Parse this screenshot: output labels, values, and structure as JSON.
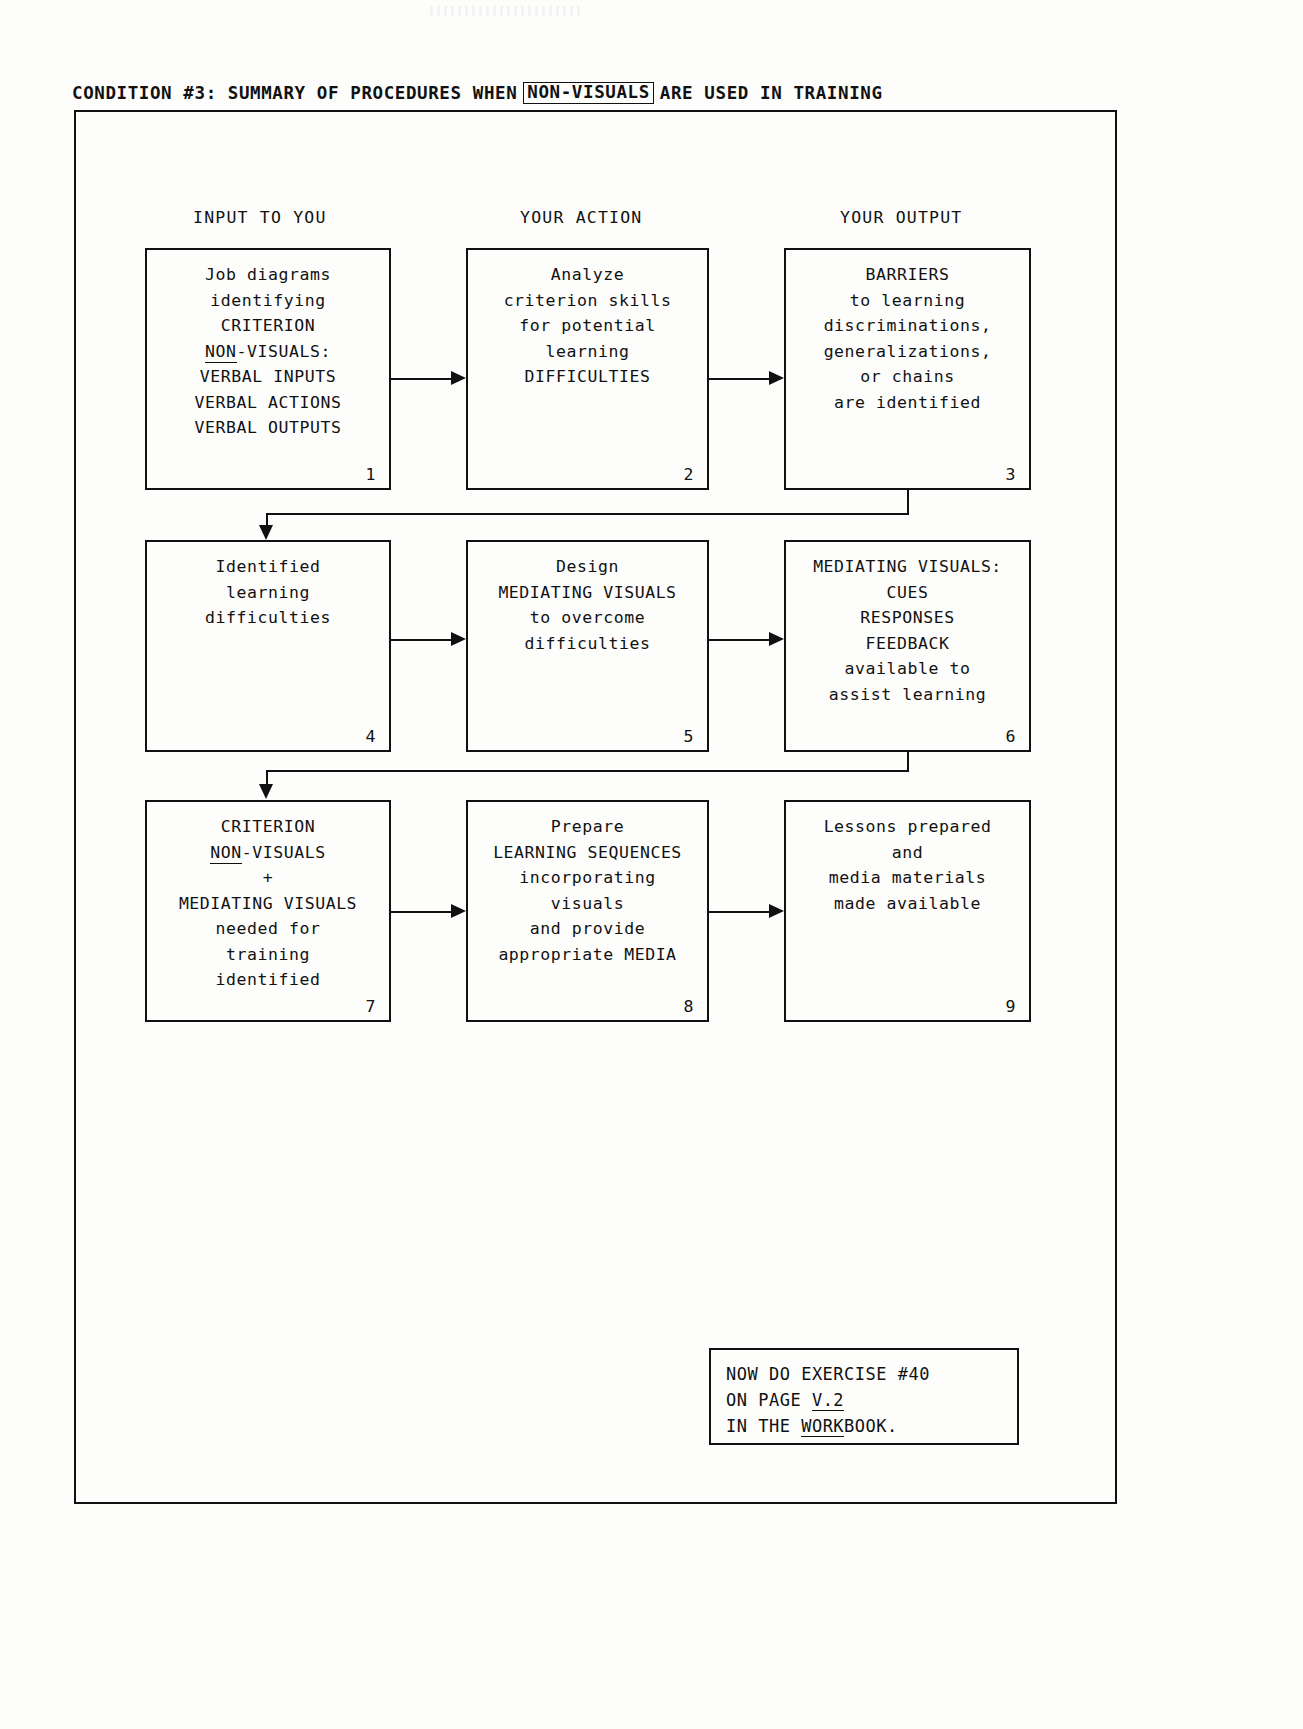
{
  "document": {
    "title_prefix": "CONDITION #3:",
    "title_mid": "SUMMARY OF PROCEDURES WHEN",
    "title_boxed_term": "NON-VISUALS",
    "title_suffix": "ARE USED IN TRAINING"
  },
  "columns": [
    {
      "label": "INPUT TO YOU"
    },
    {
      "label": "YOUR ACTION"
    },
    {
      "label": "YOUR OUTPUT"
    }
  ],
  "boxes": [
    {
      "number": "1",
      "column": "INPUT TO YOU",
      "row": 1,
      "text": "Job diagrams\nidentifying\nCRITERION",
      "underlined_line": "NON-VISUALS:",
      "underlined_part": "NON",
      "text_after": "VERBAL INPUTS\nVERBAL ACTIONS\nVERBAL OUTPUTS"
    },
    {
      "number": "2",
      "column": "YOUR ACTION",
      "row": 1,
      "text": "Analyze\ncriterion skills\nfor potential\nlearning\nDIFFICULTIES"
    },
    {
      "number": "3",
      "column": "YOUR OUTPUT",
      "row": 1,
      "text": "BARRIERS\nto learning\ndiscriminations,\ngeneralizations,\nor chains\nare identified"
    },
    {
      "number": "4",
      "column": "INPUT TO YOU",
      "row": 2,
      "text": "Identified\nlearning\ndifficulties"
    },
    {
      "number": "5",
      "column": "YOUR ACTION",
      "row": 2,
      "text": "Design\nMEDIATING VISUALS\nto overcome\ndifficulties"
    },
    {
      "number": "6",
      "column": "YOUR OUTPUT",
      "row": 2,
      "text": "MEDIATING VISUALS:\nCUES\nRESPONSES\nFEEDBACK\navailable to\nassist learning"
    },
    {
      "number": "7",
      "column": "INPUT TO YOU",
      "row": 3,
      "text": "CRITERION",
      "underlined_line": "NON-VISUALS",
      "underlined_part": "NON",
      "text_after": "+\nMEDIATING VISUALS\nneeded for\ntraining\nidentified"
    },
    {
      "number": "8",
      "column": "YOUR ACTION",
      "row": 3,
      "text": "Prepare\nLEARNING SEQUENCES\nincorporating\nvisuals\nand provide\nappropriate MEDIA"
    },
    {
      "number": "9",
      "column": "YOUR OUTPUT",
      "row": 3,
      "text": "Lessons prepared\nand\nmedia materials\nmade available"
    }
  ],
  "note": {
    "line1": "NOW DO EXERCISE #40",
    "line2_prefix": "ON PAGE ",
    "line2_underlined": "V.2",
    "line3_prefix": "IN THE ",
    "line3_underlined": "WORK",
    "line3_suffix": "BOOK."
  },
  "colors": {
    "ink": "#111111",
    "paper": "#fdfdfc"
  }
}
